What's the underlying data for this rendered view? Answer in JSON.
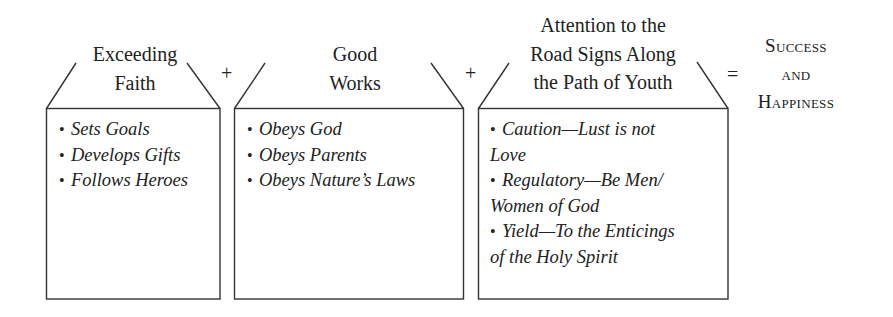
{
  "diagram": {
    "boxes": [
      {
        "heading": [
          "Exceeding",
          "Faith"
        ],
        "items": [
          {
            "text": "Sets Goals"
          },
          {
            "text": "Develops Gifts"
          },
          {
            "text": "Follows Heroes"
          }
        ]
      },
      {
        "heading": [
          "Good",
          "Works"
        ],
        "items": [
          {
            "text": "Obeys God"
          },
          {
            "text": "Obeys Parents"
          },
          {
            "text": "Obeys Nature’s Laws"
          }
        ]
      },
      {
        "heading": [
          "Attention to the",
          "Road Signs Along",
          "the Path of Youth"
        ],
        "items": [
          {
            "line1": "Caution—Lust is not",
            "line2": "Love"
          },
          {
            "line1": "Regulatory—Be Men/",
            "line2": "Women of God"
          },
          {
            "line1": "Yield—To the Enticings",
            "line2": "of the Holy Spirit"
          }
        ]
      }
    ],
    "operators": [
      "+",
      "+",
      "="
    ],
    "result": [
      "Success",
      "and",
      "Happiness"
    ],
    "bullet": "•",
    "colors": {
      "text": "#222222",
      "line": "#333333",
      "background": "#ffffff"
    }
  }
}
